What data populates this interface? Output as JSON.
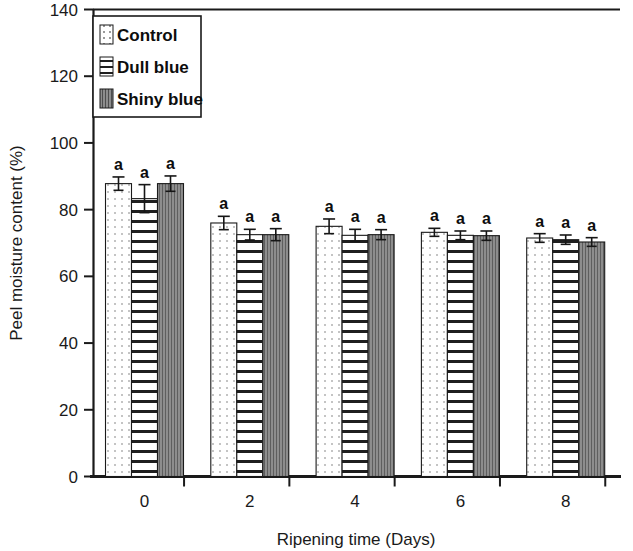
{
  "chart_data": {
    "type": "bar",
    "title": "",
    "xlabel": "Ripening time (Days)",
    "ylabel": "Peel moisture content (%)",
    "categories": [
      "0",
      "2",
      "4",
      "6",
      "8"
    ],
    "ylim": [
      0,
      140
    ],
    "yticks": [
      "0",
      "20",
      "40",
      "60",
      "80",
      "100",
      "120",
      "140"
    ],
    "ytick_values": [
      0,
      20,
      40,
      60,
      80,
      100,
      120,
      140
    ],
    "grid": false,
    "legend_position": "top-left",
    "series": [
      {
        "name": "Control",
        "pattern": "dotted",
        "values": [
          87.8,
          76.0,
          75.0,
          73.2,
          71.5
        ],
        "errors": [
          2.0,
          2.0,
          2.2,
          1.2,
          1.3
        ],
        "letters": [
          "a",
          "a",
          "a",
          "a",
          "a"
        ]
      },
      {
        "name": "Dull blue",
        "pattern": "horizontal-lines",
        "values": [
          83.3,
          72.5,
          72.3,
          72.3,
          71.0
        ],
        "errors": [
          4.2,
          1.6,
          1.8,
          1.3,
          1.4
        ],
        "letters": [
          "a",
          "a",
          "a",
          "a",
          "a"
        ]
      },
      {
        "name": "Shiny blue",
        "pattern": "vertical-lines-gray",
        "values": [
          87.8,
          72.5,
          72.5,
          72.2,
          70.3
        ],
        "errors": [
          2.3,
          1.8,
          1.5,
          1.4,
          1.3
        ],
        "letters": [
          "a",
          "a",
          "a",
          "a",
          "a"
        ]
      }
    ]
  },
  "legend": {
    "items": [
      {
        "label": "Control"
      },
      {
        "label": "Dull blue"
      },
      {
        "label": "Shiny blue"
      }
    ]
  },
  "colors": {
    "axis": "#1a1a1a",
    "control_fill": "#ffffff",
    "control_dot": "#bdbdbd",
    "dull_blue_fill": "#ffffff",
    "dull_blue_line": "#1a1a1a",
    "shiny_blue_fill": "#8a8a8a",
    "shiny_blue_line": "#5d5d5d"
  }
}
